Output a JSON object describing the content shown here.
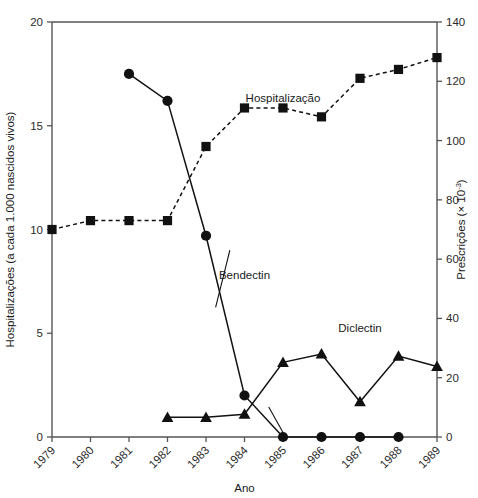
{
  "chart_data": {
    "type": "line",
    "title": "",
    "xlabel": "Ano",
    "ylabel": "Hospitalizações (a cada 1.000 nascidos vivos)",
    "y2label": "Prescrições (× 10",
    "y2label_exponent": "-3",
    "y2label_tail": ")",
    "x": [
      1979,
      1980,
      1981,
      1982,
      1983,
      1984,
      1985,
      1986,
      1987,
      1988,
      1989
    ],
    "xtick_labels": [
      "1979",
      "1980",
      "1981",
      "1982",
      "1983",
      "1984",
      "1985",
      "1986",
      "1987",
      "1988",
      "1989"
    ],
    "xlim": [
      1979,
      1989
    ],
    "ylim": [
      0,
      20
    ],
    "ytick_labels": [
      "0",
      "5",
      "10",
      "15",
      "20"
    ],
    "ytick_values": [
      0,
      5,
      10,
      15,
      20
    ],
    "y2lim": [
      0,
      140
    ],
    "y2tick_labels": [
      "0",
      "20",
      "40",
      "60",
      "80",
      "100",
      "120",
      "140"
    ],
    "y2tick_values": [
      0,
      20,
      40,
      60,
      80,
      100,
      120,
      140
    ],
    "grid": false,
    "legend_position": "inline-annotations",
    "series": [
      {
        "name": "Hospitalização",
        "axis": "right",
        "marker": "square",
        "linestyle": "dashed",
        "x": [
          1979,
          1980,
          1981,
          1982,
          1983,
          1984,
          1985,
          1986,
          1987,
          1988,
          1989
        ],
        "values": [
          70,
          73,
          73,
          73,
          98,
          111,
          111,
          108,
          121,
          124,
          128
        ],
        "label_x": 1985.0,
        "label_y": 113
      },
      {
        "name": "Bendectin",
        "axis": "left",
        "marker": "circle",
        "linestyle": "solid",
        "x": [
          1981,
          1982,
          1983,
          1984,
          1985,
          1986,
          1987,
          1988
        ],
        "values": [
          17.5,
          16.2,
          9.7,
          2.0,
          0.0,
          0.0,
          0.0,
          0.0
        ],
        "label_x": 1984.0,
        "label_y": 7.6
      },
      {
        "name": "Diclectin",
        "axis": "left",
        "marker": "triangle",
        "linestyle": "solid",
        "x": [
          1982,
          1983,
          1984,
          1985,
          1986,
          1987,
          1988,
          1989
        ],
        "values": [
          0.95,
          0.95,
          1.1,
          3.6,
          4.0,
          1.7,
          3.9,
          3.4
        ],
        "label_x": 1987.0,
        "label_y": 5.05
      }
    ],
    "annotations": [
      {
        "text": "Hospitalização"
      },
      {
        "text": "Bendectin"
      },
      {
        "text": "Diclectin"
      }
    ],
    "colors": {
      "marker": "#111111",
      "line": "#111111",
      "axis": "#555555",
      "background": "#ffffff"
    }
  }
}
